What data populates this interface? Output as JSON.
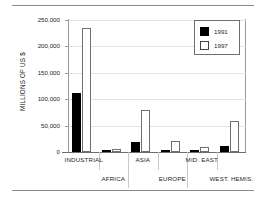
{
  "figure": {
    "has_top_rule": true,
    "has_bottom_rule": true,
    "background": "#ffffff"
  },
  "legend": {
    "position": "top-right",
    "entries": [
      {
        "label": "1991",
        "swatch": "filled-black-square",
        "color": "#000000"
      },
      {
        "label": "1997",
        "swatch": "hollow-white-square",
        "color": "#ffffff"
      }
    ]
  },
  "axis": {
    "y_title": "MILLIONS OF US $",
    "y_ticks": [
      "0",
      "50,000",
      "100,000",
      "150,000",
      "200,000",
      "250,000"
    ],
    "y_tick_values": [
      0,
      50000,
      100000,
      150000,
      200000,
      250000
    ]
  },
  "chart_data": {
    "type": "bar",
    "title": "",
    "subtitle": "",
    "xlabel": "",
    "ylabel": "MILLIONS OF US $",
    "ylim": [
      0,
      250000
    ],
    "xlim": [
      0,
      6
    ],
    "grid": true,
    "grid_axis": "y",
    "legend_position": "top-right",
    "categories": [
      "INDUSTRIAL",
      "AFRICA",
      "ASIA",
      "EUROPE",
      "MID. EAST",
      "WEST. HEMIS."
    ],
    "category_label_rows": [
      0,
      1,
      0,
      1,
      0,
      1
    ],
    "series": [
      {
        "name": "1991",
        "color": "#000000",
        "values": [
          112000,
          3000,
          19000,
          3000,
          4000,
          11000
        ]
      },
      {
        "name": "1997",
        "color": "#ffffff",
        "values": [
          235000,
          6000,
          79000,
          21000,
          9000,
          59000
        ]
      }
    ]
  }
}
